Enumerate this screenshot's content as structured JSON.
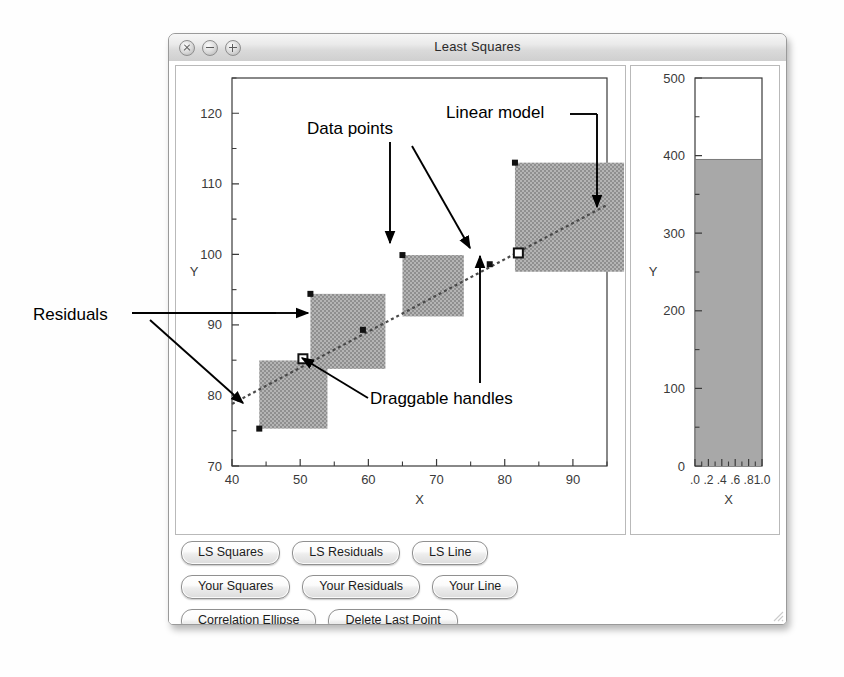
{
  "window": {
    "title": "Least Squares",
    "controls": [
      {
        "name": "close",
        "glyph": "x"
      },
      {
        "name": "minimize",
        "glyph": "-"
      },
      {
        "name": "zoom",
        "glyph": "+"
      }
    ]
  },
  "buttons": {
    "rows": [
      [
        "LS Squares",
        "LS Residuals",
        "LS Line"
      ],
      [
        "Your Squares",
        "Your Residuals",
        "Your Line"
      ],
      [
        "Correlation Ellipse",
        "Delete Last Point"
      ]
    ]
  },
  "annotations": [
    {
      "id": "data-points",
      "label": "Data points"
    },
    {
      "id": "linear-model",
      "label": "Linear model"
    },
    {
      "id": "residuals",
      "label": "Residuals"
    },
    {
      "id": "draggable-handles",
      "label": "Draggable handles"
    }
  ],
  "chart_data": [
    {
      "id": "scatter",
      "type": "scatter",
      "title": "",
      "xlabel": "X",
      "ylabel": "Y",
      "xlim": [
        40,
        95
      ],
      "ylim": [
        70,
        125
      ],
      "xticks": [
        40,
        50,
        60,
        70,
        80,
        90
      ],
      "xticks_minor": [
        45,
        55,
        65,
        75,
        85,
        95
      ],
      "yticks": [
        70,
        80,
        90,
        100,
        110,
        120
      ],
      "yticks_minor": [
        75,
        85,
        95,
        105,
        115,
        125
      ],
      "grid": false,
      "legend": "none",
      "points": [
        {
          "x": 44.0,
          "y": 75.3
        },
        {
          "x": 51.5,
          "y": 94.4
        },
        {
          "x": 59.2,
          "y": 89.3
        },
        {
          "x": 65.0,
          "y": 99.9
        },
        {
          "x": 77.8,
          "y": 98.6
        },
        {
          "x": 81.5,
          "y": 113.0
        }
      ],
      "handles": [
        {
          "x": 50.4,
          "y": 85.2
        },
        {
          "x": 82.0,
          "y": 100.2
        }
      ],
      "fit_line": {
        "name": "Linear model",
        "style": "dashed",
        "x0": 40.0,
        "y0": 78.8,
        "x1": 95.0,
        "y1": 107.0
      },
      "residual_squares": [
        {
          "x": 44.0,
          "y": 75.3,
          "size": 10.0,
          "anchor": "bottom-left"
        },
        {
          "x": 51.5,
          "y": 94.4,
          "size": 11.0,
          "anchor": "top-left"
        },
        {
          "x": 65.0,
          "y": 99.9,
          "size": 9.0,
          "anchor": "top-left"
        },
        {
          "x": 81.5,
          "y": 113.0,
          "size": 16.0,
          "anchor": "top-left"
        }
      ],
      "square_fill": "#a8a8a8"
    },
    {
      "id": "bar",
      "type": "bar",
      "title": "",
      "xlabel": "X",
      "ylabel": "Y",
      "xlim": [
        0.0,
        1.0
      ],
      "ylim": [
        0,
        500
      ],
      "xticks": [
        ".0",
        ".2",
        ".4",
        ".6",
        ".8",
        "1.0"
      ],
      "xtick_values": [
        0.0,
        0.2,
        0.4,
        0.6,
        0.8,
        1.0
      ],
      "xticks_minor": [
        0.1,
        0.3,
        0.5,
        0.7,
        0.9
      ],
      "yticks": [
        0,
        100,
        200,
        300,
        400,
        500
      ],
      "yticks_minor": [
        50,
        150,
        250,
        350,
        450
      ],
      "grid": false,
      "legend": "none",
      "categories": [
        "0.0-1.0"
      ],
      "values": [
        395
      ],
      "bar_fill": "#a8a8a8"
    }
  ],
  "colors": {
    "window_chrome": "#dadada",
    "plot_frame": "#3a3a3a",
    "square_fill": "#a8a8a8",
    "annotation": "#000000",
    "page_bg": "#fefefe"
  }
}
